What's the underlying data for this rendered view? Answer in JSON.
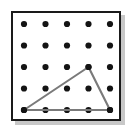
{
  "figure": {
    "name": "geoboard-triangle",
    "canvas": {
      "width": 134,
      "height": 131,
      "background": "#ffffff"
    },
    "board": {
      "x": 11,
      "y": 11,
      "width": 110,
      "height": 110,
      "fill": "#ffffff",
      "border_color": "#1a1a1a",
      "border_width": 2,
      "shadow_color": "#9a9a9a",
      "shadow_offset": 4
    },
    "grid": {
      "columns": 5,
      "rows": 5,
      "origin_x": 24,
      "origin_y": 24,
      "spacing_x": 21.5,
      "spacing_y": 21.5,
      "dot_radius": 3.1,
      "dot_color": "#141414"
    },
    "shape": {
      "type": "triangle",
      "stroke_color": "#7a7a7a",
      "stroke_width": 2.1,
      "fill": "none",
      "vertices": [
        {
          "label": "A",
          "col": 0,
          "row": 4
        },
        {
          "label": "B",
          "col": 3,
          "row": 2
        },
        {
          "label": "C",
          "col": 4,
          "row": 4
        }
      ]
    }
  }
}
